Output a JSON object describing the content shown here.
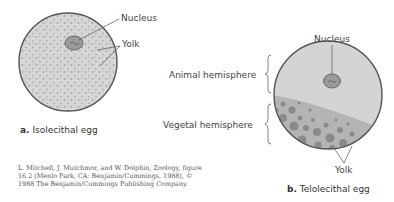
{
  "figure_a": {
    "labels": {
      "nucleus": "Nucleus",
      "yolk": "Yolk"
    },
    "caption_letter": "a.",
    "caption_text": "Isolecithal egg"
  },
  "figure_b": {
    "labels": {
      "nucleus": "Nucleus",
      "yolk": "Yolk",
      "animal_hemisphere": "Animal hemisphere",
      "vegetal_hemisphere": "Vegetal hemisphere"
    },
    "caption_letter": "b.",
    "caption_text": "Telolecithal egg"
  },
  "credit": {
    "line1": "L. Mitchell, J. Mutchmor, and W. Dolphin, Zoology, figure",
    "line2": "16.2 (Menlo Park, CA: Benjamin/Cummings, 1988), ©",
    "line3": "1988 The Benjamin/Cummings Publishing Company."
  },
  "colors": {
    "cytoplasm": "#d4d4d4",
    "outline": "#555555",
    "dots": "#8e8e8e",
    "nucleus_fill": "#9a9a9a",
    "vegetal": "#b4b4b4",
    "yolk_granule": "#8a8a8a"
  }
}
